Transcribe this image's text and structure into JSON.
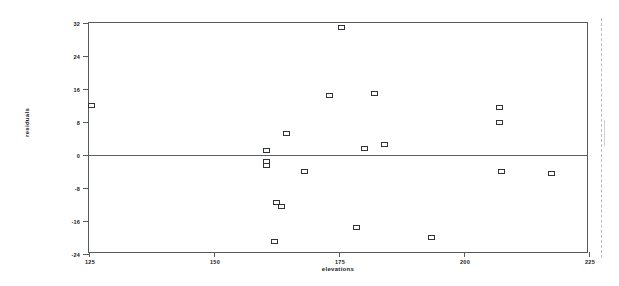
{
  "chart_data": {
    "type": "scatter",
    "title": "",
    "xlabel": "elevations",
    "ylabel": "residuals",
    "xlim": [
      125,
      225
    ],
    "ylim": [
      -24,
      32
    ],
    "xticks": [
      125,
      150,
      175,
      200,
      225
    ],
    "yticks": [
      32,
      24,
      16,
      8,
      0,
      -8,
      -16,
      -24
    ],
    "grid": false,
    "legend": null,
    "reference_lines": [
      {
        "axis": "y",
        "value": 0,
        "label": "zero-residual-line"
      }
    ],
    "marker_style": "open-square",
    "points": [
      {
        "x": 125.5,
        "y": 12.0
      },
      {
        "x": 160.5,
        "y": 1.0
      },
      {
        "x": 160.5,
        "y": -1.5
      },
      {
        "x": 160.5,
        "y": -2.5
      },
      {
        "x": 162.0,
        "y": -21.0
      },
      {
        "x": 162.5,
        "y": -11.5
      },
      {
        "x": 163.5,
        "y": -12.5
      },
      {
        "x": 164.5,
        "y": 5.2
      },
      {
        "x": 168.0,
        "y": -4.0
      },
      {
        "x": 173.0,
        "y": 14.5
      },
      {
        "x": 175.5,
        "y": 31.0
      },
      {
        "x": 178.5,
        "y": -17.5
      },
      {
        "x": 180.0,
        "y": 1.5
      },
      {
        "x": 182.0,
        "y": 15.0
      },
      {
        "x": 184.0,
        "y": 2.5
      },
      {
        "x": 193.5,
        "y": -20.0
      },
      {
        "x": 207.0,
        "y": 11.5
      },
      {
        "x": 207.0,
        "y": 8.0
      },
      {
        "x": 207.5,
        "y": -4.0
      },
      {
        "x": 217.5,
        "y": -4.5
      }
    ]
  },
  "style": {
    "axis_color": "#555a5e",
    "marker_edge_color": "#303438",
    "marker_face_color": "#ffffff",
    "text_color": "#16191c",
    "background": "#ffffff"
  }
}
